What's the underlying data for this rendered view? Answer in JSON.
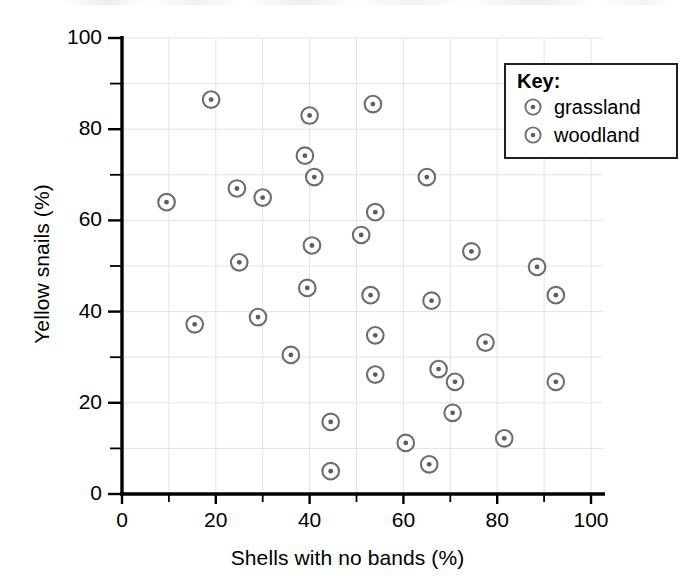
{
  "chart_data": {
    "type": "scatter",
    "title": "",
    "xlabel": "Shells with no bands (%)",
    "ylabel": "Yellow snails (%)",
    "xlim": [
      0,
      100
    ],
    "ylim": [
      0,
      100
    ],
    "xticks": [
      0,
      20,
      40,
      60,
      80,
      100
    ],
    "yticks": [
      0,
      20,
      40,
      60,
      80,
      100
    ],
    "xticks_minor": [
      10,
      30,
      50,
      70,
      90
    ],
    "yticks_minor": [
      10,
      30,
      50,
      70,
      90
    ],
    "xtick_labels": [
      "0",
      "20",
      "40",
      "60",
      "80",
      "100"
    ],
    "ytick_labels": [
      "0",
      "20",
      "40",
      "60",
      "80",
      "100"
    ],
    "grid": true,
    "grid_color": "#e3e3e6",
    "marker_color": "#6d6d72",
    "axis_color": "#000000",
    "legend_position": "top-right",
    "legend_title": "Key:",
    "series": [
      {
        "name": "grassland",
        "marker": "circle-dot",
        "points": [
          [
            9.5,
            64.0
          ],
          [
            19.0,
            86.5
          ],
          [
            24.5,
            67.0
          ],
          [
            25.0,
            50.8
          ],
          [
            30.0,
            65.0
          ],
          [
            29.0,
            38.8
          ],
          [
            36.0,
            30.5
          ],
          [
            39.0,
            74.2
          ],
          [
            40.0,
            83.0
          ],
          [
            40.5,
            54.5
          ],
          [
            39.5,
            45.2
          ],
          [
            41.0,
            69.5
          ],
          [
            44.5,
            15.8
          ],
          [
            44.5,
            5.0
          ],
          [
            51.0,
            56.8
          ],
          [
            53.5,
            85.5
          ],
          [
            53.0,
            43.6
          ],
          [
            54.0,
            61.8
          ],
          [
            54.0,
            34.8
          ],
          [
            54.0,
            26.2
          ]
        ]
      },
      {
        "name": "woodland",
        "marker": "circle-dot",
        "points": [
          [
            15.5,
            37.2
          ],
          [
            60.5,
            11.2
          ],
          [
            65.5,
            6.5
          ],
          [
            65.0,
            69.5
          ],
          [
            66.0,
            42.4
          ],
          [
            67.5,
            27.4
          ],
          [
            70.5,
            17.8
          ],
          [
            71.0,
            24.6
          ],
          [
            74.5,
            53.2
          ],
          [
            77.5,
            33.2
          ],
          [
            81.5,
            12.2
          ],
          [
            88.5,
            49.8
          ],
          [
            92.5,
            43.6
          ],
          [
            92.5,
            24.6
          ]
        ]
      }
    ]
  },
  "legend": {
    "title": "Key:",
    "entries": [
      {
        "label": "grassland",
        "marker": "circle-dot-marker"
      },
      {
        "label": "woodland",
        "marker": "circle-dot-marker"
      }
    ]
  },
  "axes": {
    "x_title": "Shells with no bands (%)",
    "y_title": "Yellow snails (%)"
  }
}
